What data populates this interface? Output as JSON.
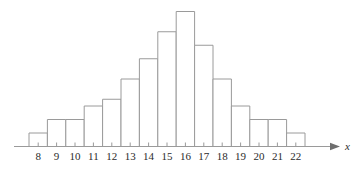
{
  "chart_data": {
    "type": "bar",
    "title": "",
    "subtitle": "",
    "xlabel": "x",
    "ylabel": "",
    "categories": [
      "8",
      "9",
      "10",
      "11",
      "12",
      "13",
      "14",
      "15",
      "16",
      "17",
      "18",
      "19",
      "20",
      "21",
      "22"
    ],
    "values": [
      1,
      2,
      2,
      3,
      3.5,
      5,
      6.5,
      8.5,
      10,
      7.5,
      5,
      3,
      2,
      2,
      1
    ],
    "tick_labels": [
      "8",
      "9",
      "10",
      "11",
      "12",
      "13",
      "14",
      "15",
      "16",
      "17",
      "18",
      "19",
      "20",
      "21",
      "22"
    ],
    "xlim": [
      7.5,
      22.5
    ],
    "ylim": [
      0,
      10
    ],
    "grid": false,
    "legend": [],
    "legend_position": "none",
    "annotations": []
  },
  "style": {
    "bar_fill": "#ffffff",
    "bar_stroke": "#9a9a9a",
    "axis_color": "#9a9a9a",
    "arrow_color": "#6e6e6e",
    "label_color": "#2b2b2b",
    "background": "#ffffff"
  },
  "axis": {
    "x_axis_label": "x",
    "arrow_icon": "arrow-right-icon"
  }
}
